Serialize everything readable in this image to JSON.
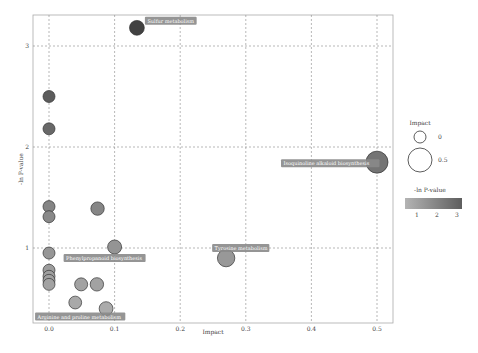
{
  "chart_data": {
    "type": "scatter",
    "title": "",
    "xlabel": "Impact",
    "ylabel": "-ln P-value",
    "xlim": [
      -0.025,
      0.525
    ],
    "ylim": [
      0.25,
      3.3
    ],
    "grid": true,
    "x_ticks": [
      "0.0",
      "0.1",
      "0.2",
      "0.3",
      "0.4",
      "0.5"
    ],
    "y_ticks": [
      "1",
      "2",
      "3"
    ],
    "points": [
      {
        "x": 0.134,
        "y": 3.18,
        "size": 0.14,
        "color_value": 3.2,
        "label": "Sulfur metabolism"
      },
      {
        "x": 0.5,
        "y": 1.85,
        "size": 0.5,
        "color_value": 1.85,
        "label": "Isoquinoline alkaloid biosynthesis"
      },
      {
        "x": 0.27,
        "y": 0.9,
        "size": 0.27,
        "color_value": 0.9,
        "label": "Tyrosine metabolism"
      },
      {
        "x": 0.1,
        "y": 1.01,
        "size": 0.1,
        "color_value": 1.0,
        "label": "Phenylpropanoid biosynthesis"
      },
      {
        "x": 0.087,
        "y": 0.4,
        "size": 0.09,
        "color_value": 0.4,
        "label": "Arginine and proline metabolism"
      },
      {
        "x": 0.0,
        "y": 2.5,
        "size": 0.0,
        "color_value": 2.5,
        "label": ""
      },
      {
        "x": 0.0,
        "y": 2.18,
        "size": 0.0,
        "color_value": 2.18,
        "label": ""
      },
      {
        "x": 0.0,
        "y": 1.41,
        "size": 0.0,
        "color_value": 1.41,
        "label": ""
      },
      {
        "x": 0.0,
        "y": 1.31,
        "size": 0.0,
        "color_value": 1.31,
        "label": ""
      },
      {
        "x": 0.0,
        "y": 0.95,
        "size": 0.0,
        "color_value": 0.95,
        "label": ""
      },
      {
        "x": 0.0,
        "y": 0.78,
        "size": 0.0,
        "color_value": 0.78,
        "label": ""
      },
      {
        "x": 0.0,
        "y": 0.72,
        "size": 0.0,
        "color_value": 0.72,
        "label": ""
      },
      {
        "x": 0.0,
        "y": 0.68,
        "size": 0.0,
        "color_value": 0.68,
        "label": ""
      },
      {
        "x": 0.0,
        "y": 0.64,
        "size": 0.0,
        "color_value": 0.64,
        "label": ""
      },
      {
        "x": 0.074,
        "y": 1.39,
        "size": 0.07,
        "color_value": 1.39,
        "label": ""
      },
      {
        "x": 0.049,
        "y": 0.64,
        "size": 0.05,
        "color_value": 0.64,
        "label": ""
      },
      {
        "x": 0.073,
        "y": 0.64,
        "size": 0.07,
        "color_value": 0.64,
        "label": ""
      },
      {
        "x": 0.04,
        "y": 0.46,
        "size": 0.04,
        "color_value": 0.46,
        "label": ""
      }
    ],
    "legend": {
      "size_title": "Impact",
      "size_entries": [
        "0",
        "0.5"
      ],
      "color_title": "-ln P-value",
      "color_ticks": [
        "1",
        "2",
        "3"
      ],
      "position": "right"
    }
  }
}
